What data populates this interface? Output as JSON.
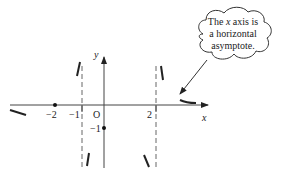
{
  "diagram": {
    "axes": {
      "x_label": "x",
      "y_label": "y",
      "origin_label": "O"
    },
    "tick_labels": {
      "x_neg2": "−2",
      "x_neg1": "−1",
      "x_2": "2",
      "y_neg1": "−1"
    },
    "vertical_asymptotes": [
      "x = −1",
      "x = 2"
    ],
    "marked_points": [
      {
        "x": -2,
        "y": 0
      },
      {
        "x": 0,
        "y": -1
      }
    ],
    "callout": {
      "line1_pre": "The ",
      "line1_var": "x",
      "line1_post": " axis is",
      "line2": "a horizontal",
      "line3": "asymptote."
    },
    "colors": {
      "axis": "#333333",
      "curve": "#222222",
      "dashed": "#555555",
      "background": "#ffffff"
    }
  }
}
